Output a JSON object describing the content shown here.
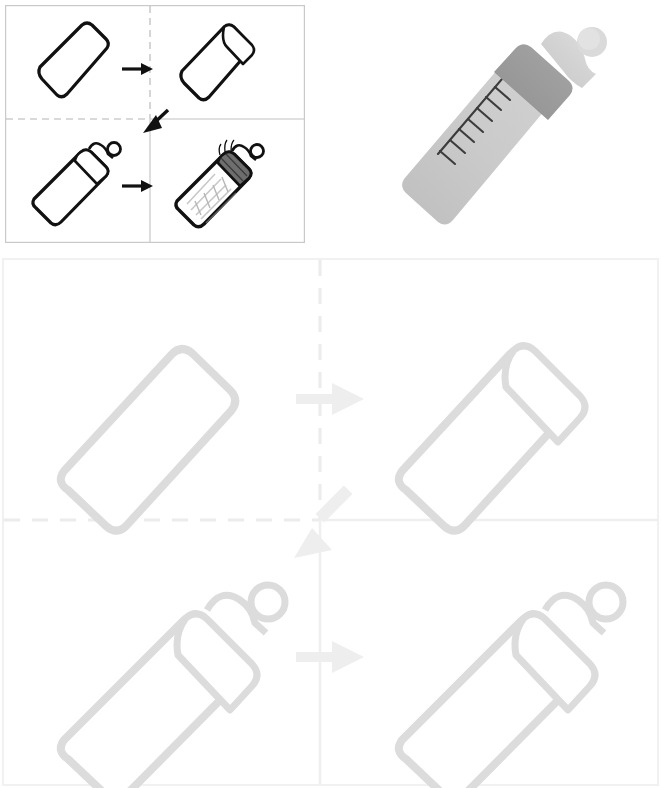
{
  "document": {
    "title_fragment": "",
    "page_background": "#ffffff"
  },
  "colors": {
    "ink": "#111111",
    "panel_border_small": "#c9c9c9",
    "divider_dashed_small": "#b4b4b4",
    "faded_ink": "#dcdcdc",
    "faded_border": "#f0f0f0",
    "faded_dashed": "#eaeaea",
    "bottle_body": "#c7c8c7",
    "bottle_body_shadow": "#bcbdbc",
    "bottle_collar": "#9b9b9b",
    "bottle_nipple": "#d9d9d9",
    "bottle_nipple_shadow": "#c4c4c4",
    "graduation_mark": "#3c3c3c",
    "texture_fill": "#8e8e8e"
  },
  "figure_small": {
    "name": "baby-bottle-assembly-steps",
    "box": {
      "x": 5,
      "y": 5,
      "width": 300,
      "height": 238
    },
    "divider_vertical_x": 150,
    "divider_horizontal_y": 119,
    "panels": [
      {
        "id": "step-1",
        "label": "empty-bottle-body",
        "position": "top-left",
        "arrow_out": "right"
      },
      {
        "id": "step-2",
        "label": "bottle-body-with-collar-ring",
        "position": "top-right",
        "arrow_out": "down-left-diagonal"
      },
      {
        "id": "step-3",
        "label": "bottle-with-nipple-attached",
        "position": "bottom-left",
        "arrow_out": "right"
      },
      {
        "id": "step-4",
        "label": "bottle-filled-shaded",
        "position": "bottom-right",
        "arrow_out": "none"
      }
    ],
    "arrows": [
      {
        "id": "arrow-step1-to-step2",
        "direction": "right",
        "x": 132,
        "y": 66
      },
      {
        "id": "arrow-step2-to-step3",
        "direction": "diagonal-down-left",
        "x": 152,
        "y": 122
      },
      {
        "id": "arrow-step3-to-step4",
        "direction": "right",
        "x": 132,
        "y": 182
      }
    ]
  },
  "figure_large_faded": {
    "name": "baby-bottle-assembly-steps-faded",
    "box": {
      "x": 2,
      "y": 258,
      "width": 657,
      "height": 528
    },
    "divider_vertical_x": 320,
    "divider_horizontal_y": 520,
    "opacity_note": "very light gray watermark duplicate of the small figure",
    "panels": [
      {
        "id": "step-1-faded",
        "label": "empty-bottle-body",
        "position": "top-left"
      },
      {
        "id": "step-2-faded",
        "label": "bottle-body-with-collar-ring",
        "position": "top-right"
      },
      {
        "id": "step-3-faded",
        "label": "bottle-with-nipple-attached",
        "position": "bottom-left"
      },
      {
        "id": "step-4-faded",
        "label": "bottle-with-nipple-attached",
        "position": "bottom-right"
      }
    ],
    "arrows": [
      {
        "id": "arrow-faded-top",
        "direction": "right"
      },
      {
        "id": "arrow-faded-diagonal",
        "direction": "diagonal-down-left"
      },
      {
        "id": "arrow-faded-bottom",
        "direction": "right"
      }
    ]
  },
  "bottle_illustration": {
    "name": "gray-baby-bottle",
    "box": {
      "x": 382,
      "y": 2,
      "width": 270,
      "height": 240
    },
    "orientation": "tilted-diagonal-nipple-top-right",
    "parts": [
      {
        "id": "bottle-body",
        "label": "body"
      },
      {
        "id": "bottle-collar",
        "label": "collar-ring"
      },
      {
        "id": "bottle-nipple",
        "label": "nipple"
      },
      {
        "id": "bottle-nipple-tip",
        "label": "nipple-tip"
      },
      {
        "id": "bottle-graduation-scale",
        "label": "measurement-scale"
      }
    ],
    "graduation_marks_count": 8
  }
}
